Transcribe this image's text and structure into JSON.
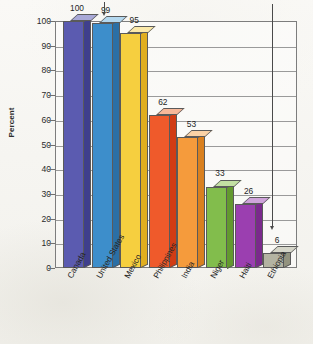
{
  "title": {
    "clipped_line": "and is much more likely to die in childbirth."
  },
  "axes": {
    "y_title": "Percent",
    "y_ticks": [
      "100",
      "90",
      "80",
      "70",
      "60",
      "50",
      "40",
      "30",
      "20",
      "10",
      "0"
    ]
  },
  "chart_data": {
    "type": "bar",
    "title": "and is much more likely to die in childbirth.",
    "xlabel": "",
    "ylabel": "Percent",
    "ylim": [
      0,
      100
    ],
    "ytick_step": 10,
    "grid": true,
    "legend": "none",
    "style": "3d-column",
    "categories": [
      "Canada",
      "United States",
      "Mexico",
      "Philippines",
      "India",
      "Niger",
      "Haiti",
      "Ethiopia"
    ],
    "values": [
      100,
      99,
      95,
      62,
      53,
      33,
      26,
      6
    ],
    "value_labels": [
      "100",
      "99",
      "95",
      "62",
      "53",
      "33",
      "26",
      "6"
    ],
    "colors": [
      "#5b5bb0",
      "#3d8ecb",
      "#f6cf3f",
      "#ef5a2b",
      "#f59b3c",
      "#82bd4c",
      "#9b3fb0",
      "#b3b3a2"
    ],
    "top_colors": [
      "#a9a9d8",
      "#b4d8ef",
      "#fbe9a9",
      "#f7b899",
      "#fad2a6",
      "#c3e0a3",
      "#cfa3da",
      "#d6d6c9"
    ],
    "side_colors": [
      "#3f3f8c",
      "#2b6fa5",
      "#e0ae1f",
      "#d13c14",
      "#d9801f",
      "#63992f",
      "#7a2a8c",
      "#93937f"
    ],
    "annotations": [
      {
        "target": "United States",
        "type": "down-arrow",
        "note": "short pointer above the 99 bar"
      },
      {
        "target": "Ethiopia",
        "type": "down-arrow",
        "note": "long vertical pointer from title down to the 6 bar"
      }
    ]
  }
}
